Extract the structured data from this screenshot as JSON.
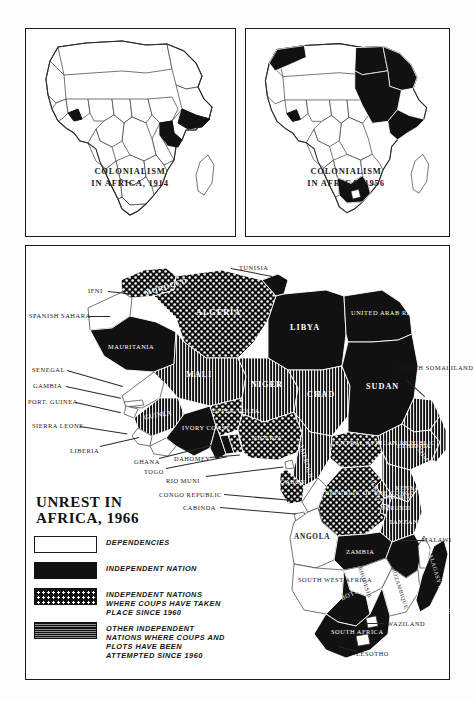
{
  "page": {
    "ink_color": "#111111",
    "paper_color": "#ffffff"
  },
  "insets": [
    {
      "id": "colonialism-1914",
      "caption_line1": "COLONIALISM",
      "caption_line2": "IN AFRICA, 1914",
      "shaded_meaning": "independent territory",
      "shaded_countries": [
        "Ethiopia",
        "Liberia"
      ]
    },
    {
      "id": "colonialism-1956",
      "caption_line1": "COLONIALISM",
      "caption_line2": "IN AFRICA, 1956",
      "shaded_meaning": "independent territory",
      "shaded_countries": [
        "Morocco",
        "Tunisia",
        "Libya",
        "Egypt",
        "Sudan",
        "Ethiopia",
        "Liberia",
        "South Africa"
      ]
    }
  ],
  "legend": {
    "title_line1": "UNREST IN",
    "title_line2": "AFRICA, 1966",
    "items": [
      {
        "swatch": "white",
        "label": "DEPENDENCIES"
      },
      {
        "swatch": "black",
        "label": "INDEPENDENT NATION"
      },
      {
        "swatch": "dots",
        "label": "INDEPENDENT NATIONS WHERE COUPS HAVE TAKEN PLACE SINCE 1960"
      },
      {
        "swatch": "hatch",
        "label": "OTHER INDEPENDENT NATIONS WHERE COUPS AND PLOTS HAVE BEEN ATTEMPTED SINCE 1960"
      }
    ]
  },
  "main_map": {
    "interior_labels": [
      {
        "name": "MOROCCO",
        "fill": "dots"
      },
      {
        "name": "ALGERIA",
        "fill": "dots"
      },
      {
        "name": "LIBYA",
        "fill": "black"
      },
      {
        "name": "UNITED ARAB REPUBLIC",
        "fill": "black"
      },
      {
        "name": "MAURITANIA",
        "fill": "black"
      },
      {
        "name": "MALI",
        "fill": "hatch"
      },
      {
        "name": "NIGER",
        "fill": "hatch"
      },
      {
        "name": "CHAD",
        "fill": "hatch"
      },
      {
        "name": "SUDAN",
        "fill": "black"
      },
      {
        "name": "ETHIOPIA",
        "fill": "hatch"
      },
      {
        "name": "SOMALIA",
        "fill": "hatch"
      },
      {
        "name": "GUINEA",
        "fill": "hatch"
      },
      {
        "name": "IVORY COAST",
        "fill": "black"
      },
      {
        "name": "UPPER VOLTA",
        "fill": "dots"
      },
      {
        "name": "NIGERIA",
        "fill": "dots"
      },
      {
        "name": "CAMEROUN",
        "fill": "hatch"
      },
      {
        "name": "CENTRAL AFRICAN REPUBLIC",
        "fill": "dots"
      },
      {
        "name": "GABON",
        "fill": "dots"
      },
      {
        "name": "REPUBLIC OF THE CONGO",
        "fill": "dots"
      },
      {
        "name": "UGANDA",
        "fill": "hatch"
      },
      {
        "name": "RWANDA",
        "fill": "hatch"
      },
      {
        "name": "BURUNDI",
        "fill": "hatch"
      },
      {
        "name": "KENYA",
        "fill": "hatch"
      },
      {
        "name": "TANZANIA",
        "fill": "hatch"
      },
      {
        "name": "ANGOLA",
        "fill": "white"
      },
      {
        "name": "ZAMBIA",
        "fill": "black"
      },
      {
        "name": "BOTSWANA",
        "fill": "black"
      },
      {
        "name": "RHODESIA",
        "fill": "white"
      },
      {
        "name": "MOZAMBIQUE",
        "fill": "white"
      },
      {
        "name": "MALAGASY REPUBLIC",
        "fill": "black"
      },
      {
        "name": "SOUTH AFRICA",
        "fill": "black"
      },
      {
        "name": "SOUTH WEST AFRICA",
        "fill": "white"
      }
    ],
    "leader_labels": [
      "TUNISIA",
      "IFNI",
      "SPANISH SAHARA",
      "SENEGAL",
      "GAMBIA",
      "PORT. GUINEA",
      "SIERRA LEONE",
      "LIBERIA",
      "GHANA",
      "TOGO",
      "DAHOMEY",
      "RIO MUNI",
      "CONGO REPUBLIC",
      "CABINDA",
      "FRENCH SOMALILAND",
      "MALAWI",
      "SWAZILAND",
      "LESOTHO"
    ]
  }
}
